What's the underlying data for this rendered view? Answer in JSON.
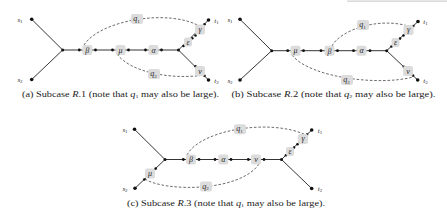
{
  "figure": {
    "panels": [
      {
        "id": "a",
        "terminals": {
          "s1": {
            "name": "s",
            "sub": "1"
          },
          "s2": {
            "name": "s",
            "sub": "2"
          },
          "t1": {
            "name": "t",
            "sub": "1"
          },
          "t2": {
            "name": "t",
            "sub": "2"
          }
        },
        "edge_labels": {
          "beta": "β",
          "mu": "μ",
          "alpha": "α",
          "epsilon": "ε",
          "gamma": "γ",
          "nu": "ν"
        },
        "paths": {
          "q1": {
            "name": "q",
            "sub": "1"
          },
          "q2": {
            "name": "q",
            "sub": "2"
          }
        },
        "caption": {
          "prefix": "(a) Subcase ",
          "case_letter": "R",
          "case_num": ".1",
          "middle": " (note that ",
          "var": "q",
          "var_sub": "1",
          "suffix": " may also be large)."
        }
      },
      {
        "id": "b",
        "terminals": {
          "s1": {
            "name": "s",
            "sub": "1"
          },
          "s2": {
            "name": "s",
            "sub": "2"
          },
          "t1": {
            "name": "t",
            "sub": "1"
          },
          "t2": {
            "name": "t",
            "sub": "2"
          }
        },
        "edge_labels": {
          "mu": "μ",
          "beta": "β",
          "alpha": "α",
          "epsilon": "ε",
          "gamma": "γ",
          "nu": "ν"
        },
        "paths": {
          "q1": {
            "name": "q",
            "sub": "1"
          },
          "q2": {
            "name": "q",
            "sub": "2"
          }
        },
        "caption": {
          "prefix": "(b) Subcase ",
          "case_letter": "R",
          "case_num": ".2",
          "middle": " (note that ",
          "var": "q",
          "var_sub": "2",
          "suffix": " may also be large)."
        }
      },
      {
        "id": "c",
        "terminals": {
          "s1": {
            "name": "s",
            "sub": "1"
          },
          "s2": {
            "name": "s",
            "sub": "2"
          },
          "t1": {
            "name": "t",
            "sub": "1"
          },
          "t2": {
            "name": "t",
            "sub": "2"
          }
        },
        "edge_labels": {
          "beta": "β",
          "alpha": "α",
          "nu": "ν",
          "epsilon": "ε",
          "gamma": "γ",
          "mu": "μ"
        },
        "paths": {
          "q1": {
            "name": "q",
            "sub": "1"
          },
          "q2": {
            "name": "q",
            "sub": "2"
          }
        },
        "caption": {
          "prefix": "(c) Subcase ",
          "case_letter": "R",
          "case_num": ".3",
          "middle": " (note that ",
          "var": "q",
          "var_sub": "1",
          "suffix": " may also be large)."
        }
      }
    ]
  }
}
